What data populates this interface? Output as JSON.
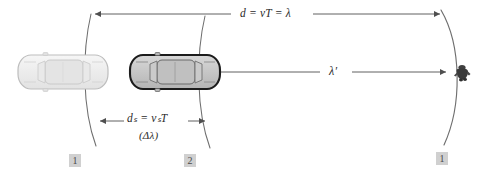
{
  "figure": {
    "background_color": "#ffffff",
    "width": 495,
    "height": 181
  },
  "labels": {
    "top_arrow": {
      "text": "d = vT = λ",
      "meaning": "wave travel distance equals wave speed times period equals wavelength"
    },
    "middle_arrow": {
      "text": "λ′",
      "meaning": "shortened wavelength seen by observer"
    },
    "source_shift_arrow": {
      "text": "dₛ = vₛT",
      "meaning": "distance moved by the source in one period"
    },
    "source_shift_sub": {
      "text": "(Δλ)",
      "meaning": "wavelength change"
    }
  },
  "position_markers": [
    {
      "name": "car-position-1-left",
      "label": "1"
    },
    {
      "name": "car-position-2",
      "label": "2"
    },
    {
      "name": "wavefront-position-1-right",
      "label": "1"
    }
  ],
  "objects": {
    "car_position_1": {
      "name": "car-light",
      "fill": "#efefef",
      "stroke": "#b8b8b8",
      "description": "car at earlier position 1, drawn light / faded"
    },
    "car_position_2": {
      "name": "car-dark",
      "fill": "#c9c9c9",
      "stroke": "#1c1c1c",
      "description": "car at later position 2, drawn solid with dark outline"
    },
    "observer": {
      "name": "observer-figure",
      "fill": "#3a3a3a",
      "description": "small dark figure of a standing observer seen from above"
    },
    "wavefronts": [
      {
        "name": "wavefront-arc-1",
        "stroke": "#6e6e6e",
        "description": "arc emitted at position 1, left"
      },
      {
        "name": "wavefront-arc-2",
        "stroke": "#6e6e6e",
        "description": "arc emitted at position 2, middle"
      },
      {
        "name": "wavefront-arc-3",
        "stroke": "#6e6e6e",
        "description": "arc arriving at observer, right"
      }
    ]
  },
  "colors": {
    "line": "#6e6e6e",
    "arrow": "#4f4f4f",
    "text": "#2b2b2b",
    "marker_bg": "#d0d0d0",
    "marker_text": "#4a4a4a"
  }
}
